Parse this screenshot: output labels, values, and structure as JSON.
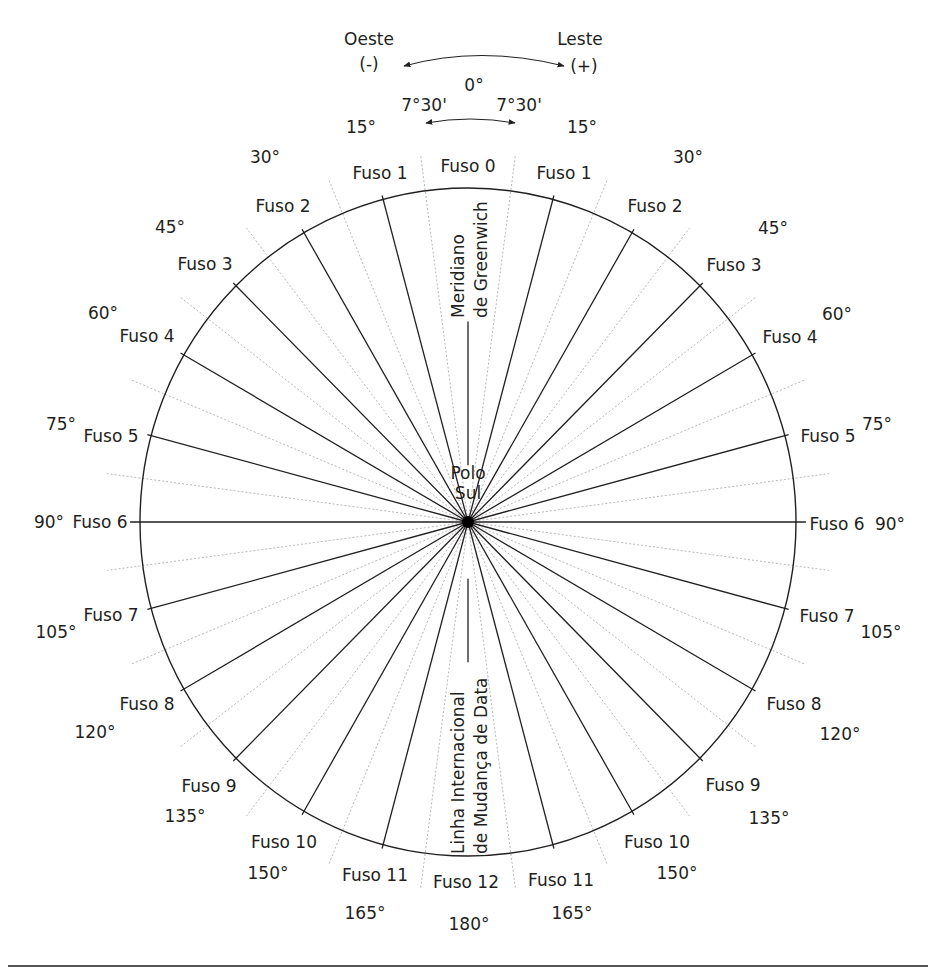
{
  "diagram": {
    "title_directions": {
      "west": "Oeste",
      "west_sign": "(-)",
      "east": "Leste",
      "east_sign": "(+)"
    },
    "center_degree": "0°",
    "half_width_left": "7°30'",
    "half_width_right": "7°30'",
    "pole_label_line1": "Polo",
    "pole_label_line2": "Sul",
    "greenwich_line1": "Meridiano",
    "greenwich_line2": "de Greenwich",
    "dateline_line1": "Linha Internacional",
    "dateline_line2": "de Mudança de Data",
    "colors": {
      "ink": "#231f20",
      "dotted": "#b8b8b8",
      "rule": "#555555"
    },
    "geometry": {
      "cx": 468,
      "cy": 522,
      "rx": 328,
      "ry": 334
    }
  },
  "chart_data": {
    "type": "polar-diagram",
    "zone_width_deg": 15,
    "zone_half_width": "7°30'",
    "zones": [
      {
        "name": "Fuso 0",
        "center_deg": 0,
        "side": "center"
      },
      {
        "name": "Fuso 1",
        "center_deg": 15,
        "side": "both"
      },
      {
        "name": "Fuso 2",
        "center_deg": 30,
        "side": "both"
      },
      {
        "name": "Fuso 3",
        "center_deg": 45,
        "side": "both"
      },
      {
        "name": "Fuso 4",
        "center_deg": 60,
        "side": "both"
      },
      {
        "name": "Fuso 5",
        "center_deg": 75,
        "side": "both"
      },
      {
        "name": "Fuso 6",
        "center_deg": 90,
        "side": "both"
      },
      {
        "name": "Fuso 7",
        "center_deg": 105,
        "side": "both"
      },
      {
        "name": "Fuso 8",
        "center_deg": 120,
        "side": "both"
      },
      {
        "name": "Fuso 9",
        "center_deg": 135,
        "side": "both"
      },
      {
        "name": "Fuso 10",
        "center_deg": 150,
        "side": "both"
      },
      {
        "name": "Fuso 11",
        "center_deg": 165,
        "side": "both"
      },
      {
        "name": "Fuso 12",
        "center_deg": 180,
        "side": "center"
      }
    ],
    "annotations": [
      "Oeste (-)",
      "Leste (+)",
      "Meridiano de Greenwich",
      "Linha Internacional de Mudança de Data",
      "Polo Sul"
    ]
  },
  "labels": {
    "zones": [
      {
        "text": "Fuso 0",
        "x": 468,
        "y": 156,
        "a": "c"
      },
      {
        "text": "Fuso 1",
        "x": 380,
        "y": 163,
        "a": "c"
      },
      {
        "text": "Fuso 1",
        "x": 564,
        "y": 163,
        "a": "c"
      },
      {
        "text": "Fuso 2",
        "x": 283,
        "y": 196,
        "a": "c"
      },
      {
        "text": "Fuso 2",
        "x": 655,
        "y": 196,
        "a": "c"
      },
      {
        "text": "Fuso 3",
        "x": 205,
        "y": 254,
        "a": "c"
      },
      {
        "text": "Fuso 3",
        "x": 734,
        "y": 255,
        "a": "c"
      },
      {
        "text": "Fuso 4",
        "x": 147,
        "y": 326,
        "a": "c"
      },
      {
        "text": "Fuso 4",
        "x": 790,
        "y": 327,
        "a": "c"
      },
      {
        "text": "Fuso 5",
        "x": 111,
        "y": 426,
        "a": "c"
      },
      {
        "text": "Fuso 5",
        "x": 828,
        "y": 426,
        "a": "c"
      },
      {
        "text": "Fuso 6",
        "x": 100,
        "y": 512,
        "a": "c"
      },
      {
        "text": "Fuso 6",
        "x": 837,
        "y": 514,
        "a": "c"
      },
      {
        "text": "Fuso 7",
        "x": 111,
        "y": 605,
        "a": "c"
      },
      {
        "text": "Fuso 7",
        "x": 827,
        "y": 606,
        "a": "c"
      },
      {
        "text": "Fuso 8",
        "x": 147,
        "y": 694,
        "a": "c"
      },
      {
        "text": "Fuso 8",
        "x": 794,
        "y": 694,
        "a": "c"
      },
      {
        "text": "Fuso 9",
        "x": 209,
        "y": 776,
        "a": "c"
      },
      {
        "text": "Fuso 9",
        "x": 733,
        "y": 775,
        "a": "c"
      },
      {
        "text": "Fuso 10",
        "x": 284,
        "y": 832,
        "a": "c"
      },
      {
        "text": "Fuso 10",
        "x": 657,
        "y": 832,
        "a": "c"
      },
      {
        "text": "Fuso 11",
        "x": 375,
        "y": 865,
        "a": "c"
      },
      {
        "text": "Fuso 11",
        "x": 561,
        "y": 870,
        "a": "c"
      },
      {
        "text": "Fuso 12",
        "x": 466,
        "y": 872,
        "a": "c"
      }
    ],
    "degrees": [
      {
        "text": "15°",
        "x": 361,
        "y": 117,
        "a": "c"
      },
      {
        "text": "15°",
        "x": 582,
        "y": 117,
        "a": "c"
      },
      {
        "text": "30°",
        "x": 265,
        "y": 147,
        "a": "c"
      },
      {
        "text": "30°",
        "x": 688,
        "y": 147,
        "a": "c"
      },
      {
        "text": "45°",
        "x": 170,
        "y": 217,
        "a": "c"
      },
      {
        "text": "45°",
        "x": 773,
        "y": 218,
        "a": "c"
      },
      {
        "text": "60°",
        "x": 103,
        "y": 303,
        "a": "c"
      },
      {
        "text": "60°",
        "x": 837,
        "y": 304,
        "a": "c"
      },
      {
        "text": "75°",
        "x": 61,
        "y": 414,
        "a": "c"
      },
      {
        "text": "75°",
        "x": 877,
        "y": 414,
        "a": "c"
      },
      {
        "text": "90°",
        "x": 49,
        "y": 512,
        "a": "c"
      },
      {
        "text": "90°",
        "x": 890,
        "y": 514,
        "a": "c"
      },
      {
        "text": "105°",
        "x": 56,
        "y": 622,
        "a": "c"
      },
      {
        "text": "105°",
        "x": 881,
        "y": 622,
        "a": "c"
      },
      {
        "text": "120°",
        "x": 95,
        "y": 722,
        "a": "c"
      },
      {
        "text": "120°",
        "x": 840,
        "y": 724,
        "a": "c"
      },
      {
        "text": "135°",
        "x": 185,
        "y": 806,
        "a": "c"
      },
      {
        "text": "135°",
        "x": 769,
        "y": 808,
        "a": "c"
      },
      {
        "text": "150°",
        "x": 268,
        "y": 863,
        "a": "c"
      },
      {
        "text": "150°",
        "x": 677,
        "y": 863,
        "a": "c"
      },
      {
        "text": "165°",
        "x": 365,
        "y": 903,
        "a": "c"
      },
      {
        "text": "165°",
        "x": 572,
        "y": 903,
        "a": "c"
      },
      {
        "text": "180°",
        "x": 469,
        "y": 914,
        "a": "c"
      }
    ]
  }
}
